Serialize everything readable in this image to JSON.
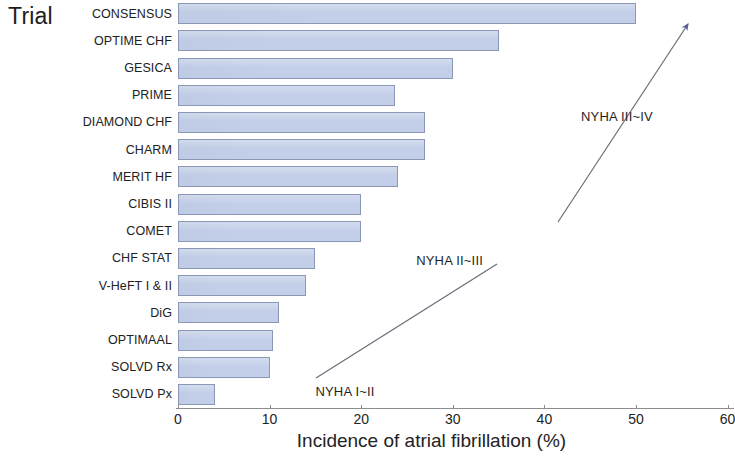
{
  "chart_data": {
    "type": "bar",
    "orientation": "horizontal",
    "title": "",
    "xlabel": "Incidence of atrial fibrillation (%)",
    "ylabel": "Trial",
    "xlim": [
      0,
      60
    ],
    "xticks": [
      0,
      10,
      20,
      30,
      40,
      50,
      60
    ],
    "xtick_labels": [
      "0",
      "10",
      "20",
      "30",
      "40",
      "50",
      "60"
    ],
    "grid": false,
    "legend": null,
    "bar_color": "#c3cfe8",
    "bar_edge_color": "#8b97b6",
    "categories": [
      "CONSENSUS",
      "OPTIME CHF",
      "GESICA",
      "PRIME",
      "DIAMOND CHF",
      "CHARM",
      "MERIT HF",
      "CIBIS II",
      "COMET",
      "CHF STAT",
      "V-HeFT I & II",
      "DiG",
      "OPTIMAAL",
      "SOLVD Rx",
      "SOLVD Px"
    ],
    "values": [
      50,
      35,
      30,
      23.7,
      27,
      27,
      24,
      20,
      20,
      15,
      14,
      11,
      10.4,
      10,
      4
    ],
    "annotations": [
      {
        "text": "NYHA III~IV",
        "x": 44,
        "y_row": 4
      },
      {
        "text": "NYHA II~III",
        "x": 26,
        "y_row": 9.3
      },
      {
        "text": "NYHA I~II",
        "x": 15,
        "y_row": 14.1
      }
    ],
    "arrow": {
      "color": "#5a5f9e",
      "description": "diagonal arrow from lower-left to upper-right indicating increasing NYHA class"
    }
  },
  "labels": {
    "y_axis_caption": "Trial",
    "x_axis_caption": "Incidence of atrial fibrillation (%)"
  }
}
